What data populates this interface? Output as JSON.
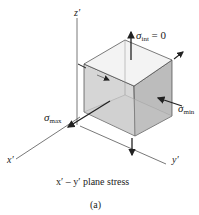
{
  "axes": {
    "z_label": "z′",
    "x_label": "x′",
    "y_label": "y′"
  },
  "stresses": {
    "int": {
      "symbol": "σ",
      "subscript": "int",
      "suffix": " = 0"
    },
    "max": {
      "symbol": "σ",
      "subscript": "max"
    },
    "min": {
      "symbol": "σ",
      "subscript": "min"
    }
  },
  "caption": "x′ – y′ plane stress",
  "figure_label": "(a)",
  "colors": {
    "line": "#333333",
    "face_top": "#f4f4f4",
    "face_left": "#d4d4d4",
    "face_right": "#b9b9b9",
    "arrow": "#222222"
  }
}
